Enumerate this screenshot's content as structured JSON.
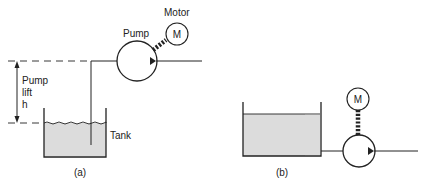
{
  "figure_a": {
    "caption": "(a)",
    "motor_label": "Motor",
    "pump_label": "Pump",
    "motor_symbol": "M",
    "lift_label_line1": "Pump",
    "lift_label_line2": "lift",
    "lift_label_line3": "h",
    "tank_label": "Tank"
  },
  "figure_b": {
    "caption": "(b)",
    "motor_symbol": "M"
  },
  "colors": {
    "line": "#222222",
    "liquid": "#dcdcdc"
  }
}
